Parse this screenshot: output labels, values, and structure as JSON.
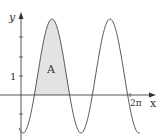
{
  "figure": {
    "function": "y = 1 - 3cos(2x)",
    "y_axis_label": "y",
    "x_axis_label": "x",
    "y_tick_label": "1",
    "x_tick_label": "2π",
    "region_label": "A",
    "colors": {
      "curve": "#444444",
      "axis": "#444444",
      "shade": "#e3e3e3"
    }
  }
}
